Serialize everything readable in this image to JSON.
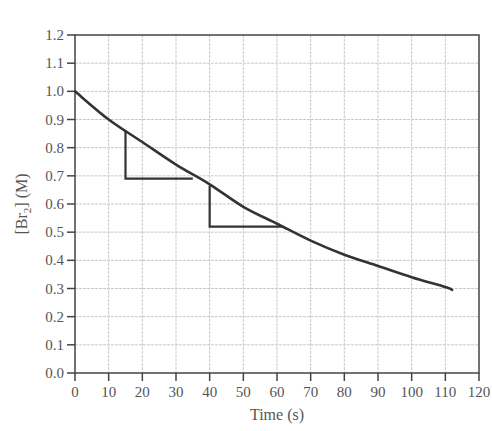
{
  "chart_data": {
    "type": "line",
    "title": "",
    "xlabel": "Time (s)",
    "ylabel": "[Br2] (M)",
    "ylabel_main": "[Br",
    "ylabel_sub": "2",
    "ylabel_tail": "] (M)",
    "xlim": [
      0,
      120
    ],
    "ylim": [
      0.0,
      1.2
    ],
    "grid": true,
    "x_ticks": [
      0,
      10,
      20,
      30,
      40,
      50,
      60,
      70,
      80,
      90,
      100,
      110,
      120
    ],
    "y_ticks": [
      "0.0",
      "0.1",
      "0.2",
      "0.3",
      "0.4",
      "0.5",
      "0.6",
      "0.7",
      "0.8",
      "0.9",
      "1.0",
      "1.1",
      "1.2"
    ],
    "series": [
      {
        "name": "[Br2] concentration",
        "x": [
          0,
          10,
          20,
          30,
          40,
          50,
          60,
          70,
          80,
          90,
          100,
          110,
          112
        ],
        "values": [
          1.0,
          0.9,
          0.82,
          0.74,
          0.67,
          0.59,
          0.53,
          0.47,
          0.42,
          0.38,
          0.34,
          0.305,
          0.295
        ]
      }
    ],
    "annotations": [
      {
        "type": "slope-triangle",
        "x1": 15,
        "y1": 0.86,
        "x2": 35,
        "y2": 0.69
      },
      {
        "type": "slope-triangle",
        "x1": 40,
        "y1": 0.665,
        "x2": 62,
        "y2": 0.52
      }
    ]
  },
  "colors": {
    "curve": "#333333",
    "axis": "#444444",
    "grid": "#c8c8c8",
    "text": "#555555"
  }
}
